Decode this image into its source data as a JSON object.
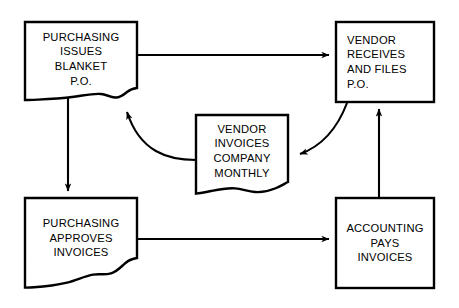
{
  "diagram": {
    "type": "flowchart",
    "stroke_color": "#000000",
    "background_color": "#ffffff",
    "nodes": [
      {
        "id": "purchasing-issues",
        "lines": [
          "PURCHASING",
          "ISSUES",
          "BLANKET",
          "P.O."
        ],
        "shape": "torn-bottom-rectangle",
        "align": "center"
      },
      {
        "id": "vendor-receives",
        "lines": [
          "VENDOR",
          "RECEIVES",
          "AND FILES",
          "P.O."
        ],
        "shape": "rectangle",
        "align": "left"
      },
      {
        "id": "vendor-invoices",
        "lines": [
          "VENDOR",
          "INVOICES",
          "COMPANY",
          "MONTHLY"
        ],
        "shape": "torn-bottom-rectangle",
        "align": "center"
      },
      {
        "id": "purchasing-approves",
        "lines": [
          "PURCHASING",
          "APPROVES",
          "INVOICES"
        ],
        "shape": "torn-bottom-rectangle",
        "align": "center"
      },
      {
        "id": "accounting-pays",
        "lines": [
          "ACCOUNTING",
          "PAYS",
          "INVOICES"
        ],
        "shape": "rectangle",
        "align": "center"
      }
    ],
    "connectors": [
      {
        "id": "issues-to-receives",
        "from": "purchasing-issues",
        "to": "vendor-receives",
        "style": "straight",
        "direction": "right"
      },
      {
        "id": "issues-to-approves",
        "from": "purchasing-issues",
        "to": "purchasing-approves",
        "style": "straight",
        "direction": "down"
      },
      {
        "id": "approves-to-pays",
        "from": "purchasing-approves",
        "to": "accounting-pays",
        "style": "straight",
        "direction": "right"
      },
      {
        "id": "pays-to-receives",
        "from": "accounting-pays",
        "to": "vendor-receives",
        "style": "straight",
        "direction": "up"
      },
      {
        "id": "receives-to-invoices",
        "from": "vendor-receives",
        "to": "vendor-invoices",
        "style": "curved",
        "direction": "left"
      },
      {
        "id": "invoices-to-issues",
        "from": "vendor-invoices",
        "to": "purchasing-issues",
        "style": "curved",
        "direction": "up-left"
      }
    ]
  }
}
